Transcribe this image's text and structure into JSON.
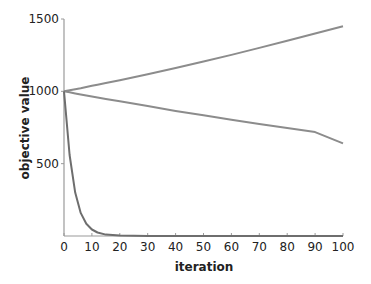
{
  "chart_data": {
    "type": "line",
    "title": "",
    "xlabel": "iteration",
    "ylabel": "objective value",
    "xlim": [
      0,
      100
    ],
    "ylim": [
      0,
      1500
    ],
    "grid": false,
    "legend": null,
    "x_ticks": [
      "0",
      "10",
      "20",
      "30",
      "40",
      "50",
      "60",
      "70",
      "80",
      "90",
      "100"
    ],
    "y_ticks": [
      "500",
      "1000",
      "1500"
    ],
    "x": [
      0,
      2,
      4,
      6,
      8,
      10,
      12,
      15,
      20,
      30,
      40,
      50,
      60,
      70,
      80,
      90,
      100
    ],
    "series": [
      {
        "name": "increasing",
        "color": "#8c8c8c",
        "values": [
          1000,
          1007,
          1015,
          1022,
          1030,
          1038,
          1046,
          1057,
          1077,
          1118,
          1161,
          1206,
          1252,
          1300,
          1350,
          1400,
          1450
        ]
      },
      {
        "name": "slow decrease",
        "color": "#8c8c8c",
        "values": [
          1000,
          993,
          986,
          978,
          971,
          964,
          958,
          948,
          931,
          898,
          865,
          834,
          803,
          774,
          746,
          718,
          640
        ]
      },
      {
        "name": "fast decrease",
        "color": "#6e6e6e",
        "values": [
          1000,
          560,
          300,
          160,
          85,
          45,
          24,
          10,
          3,
          0,
          0,
          0,
          0,
          0,
          0,
          0,
          0
        ]
      }
    ]
  }
}
